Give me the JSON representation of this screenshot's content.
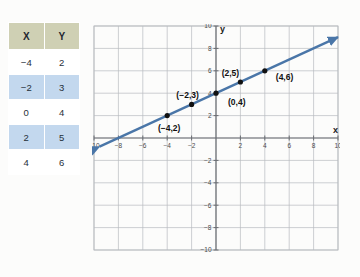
{
  "table": {
    "headers": [
      "X",
      "Y"
    ],
    "rows": [
      {
        "x": "−4",
        "y": "2"
      },
      {
        "x": "−2",
        "y": "3"
      },
      {
        "x": "0",
        "y": "4"
      },
      {
        "x": "2",
        "y": "5"
      },
      {
        "x": "4",
        "y": "6"
      }
    ],
    "header_bg": "#cfd0b4",
    "row_alt_bg": "#c3d8ee"
  },
  "graph": {
    "x_axis_label": "x",
    "y_axis_label": "y",
    "line_color": "#4a76a8",
    "point_color": "#111111",
    "grid_color": "#b9bcc0",
    "axis_color": "#6a6d72",
    "x_ticks": [
      "−10",
      "−8",
      "−6",
      "−4",
      "−2",
      "",
      "2",
      "4",
      "6",
      "8",
      "10"
    ],
    "y_ticks": [
      "10",
      "8",
      "6",
      "4",
      "2",
      "",
      "−2",
      "−4",
      "−6",
      "−8",
      "−10"
    ],
    "x_tick_values": [
      -10,
      -8,
      -6,
      -4,
      -2,
      0,
      2,
      4,
      6,
      8,
      10
    ],
    "y_tick_values": [
      10,
      8,
      6,
      4,
      2,
      0,
      -2,
      -4,
      -6,
      -8,
      -10
    ],
    "point_labels": [
      {
        "text": "(−4,2)",
        "x": -4,
        "y": 2
      },
      {
        "text": "(−2,3)",
        "x": -2,
        "y": 3
      },
      {
        "text": "(0,4)",
        "x": 0,
        "y": 4
      },
      {
        "text": "(2,5)",
        "x": 2,
        "y": 5
      },
      {
        "text": "(4,6)",
        "x": 4,
        "y": 6
      }
    ]
  },
  "chart_data": {
    "type": "line",
    "title": "",
    "xlabel": "x",
    "ylabel": "y",
    "xlim": [
      -10,
      10
    ],
    "ylim": [
      -10,
      10
    ],
    "grid": true,
    "legend": "none",
    "x": [
      -4,
      -2,
      0,
      2,
      4
    ],
    "series": [
      {
        "name": "y = 0.5x + 4",
        "values": [
          2,
          3,
          4,
          5,
          6
        ]
      }
    ],
    "annotations": [
      "(−4,2)",
      "(−2,3)",
      "(0,4)",
      "(2,5)",
      "(4,6)"
    ],
    "line_extends_with_arrows": true,
    "slope": 0.5,
    "intercept": 4
  }
}
